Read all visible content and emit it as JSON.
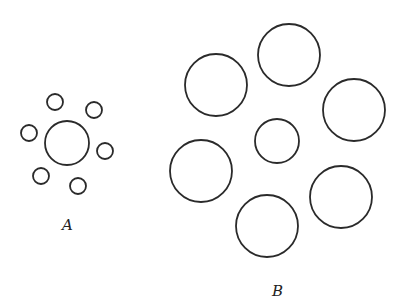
{
  "figures": [
    {
      "label": "A",
      "description": "Central circle surrounded by six small circles",
      "surround_count": 6,
      "surround_size": "small"
    },
    {
      "label": "B",
      "description": "Central circle surrounded by six large circles",
      "surround_count": 6,
      "surround_size": "large"
    }
  ],
  "colors": {
    "stroke": "#2a2a2a",
    "background": "#ffffff"
  }
}
